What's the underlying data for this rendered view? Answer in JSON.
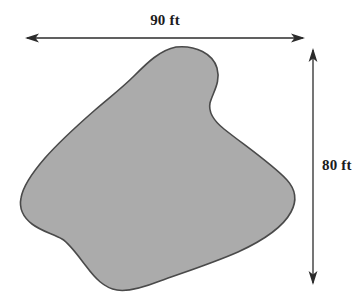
{
  "figure": {
    "type": "geometry-dimension-diagram",
    "background_color": "#ffffff",
    "shape": {
      "name": "irregular-region",
      "fill_color": "#ababab",
      "stroke_color": "#4a4a4a",
      "stroke_width": 1.6,
      "path": "M 176 47 C 196 45 213 54 217 68 C 221 82 213 92 210 103 C 208 113 214 121 224 129 C 244 145 272 164 287 180 C 296 190 297 201 291 212 C 283 227 262 241 238 252 C 213 263 185 272 160 281 C 142 288 128 292 117 290 C 104 288 95 278 86 266 C 76 253 69 243 62 239 C 53 234 41 231 32 224 C 23 217 19 208 21 198 C 23 186 32 173 45 158 C 60 141 79 124 95 110 C 110 97 122 88 134 76 C 147 63 160 50 176 47 Z"
    },
    "dimensions": {
      "width": {
        "label": "90 ft",
        "value": 90,
        "unit": "ft",
        "orientation": "horizontal",
        "arrow_style": "double-headed"
      },
      "height": {
        "label": "80 ft",
        "value": 80,
        "unit": "ft",
        "orientation": "vertical",
        "arrow_style": "double-headed"
      }
    },
    "arrow_color": "#2b2b2b"
  }
}
